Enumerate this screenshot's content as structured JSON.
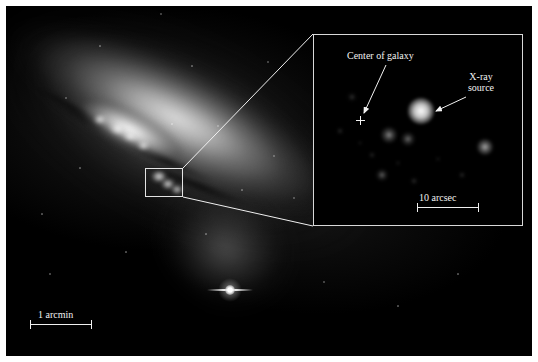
{
  "figure": {
    "domain": "astronomy-image",
    "background_color": "#ffffff",
    "plate_color": "#000000",
    "annotation_color": "#f2f2f2"
  },
  "main_image": {
    "name": "starburst-galaxy-m82",
    "description": "Optical image of an edge-on starburst galaxy with bright nucleus and dust lanes",
    "scalebar": {
      "label": "1 arcmin",
      "length_px": 62
    },
    "zoom_box": {
      "label": "nucleus-region",
      "x": 139,
      "y": 162,
      "width": 38,
      "height": 29
    },
    "bright_star": {
      "label": "foreground-star",
      "x": 224,
      "y": 284
    },
    "field_stars": [
      {
        "x": 60,
        "y": 92,
        "r": 0.8
      },
      {
        "x": 94,
        "y": 40,
        "r": 0.7
      },
      {
        "x": 155,
        "y": 8,
        "r": 1.0
      },
      {
        "x": 186,
        "y": 60,
        "r": 0.7
      },
      {
        "x": 212,
        "y": 120,
        "r": 0.8
      },
      {
        "x": 262,
        "y": 56,
        "r": 0.8
      },
      {
        "x": 268,
        "y": 150,
        "r": 0.9
      },
      {
        "x": 288,
        "y": 192,
        "r": 0.8
      },
      {
        "x": 74,
        "y": 162,
        "r": 0.7
      },
      {
        "x": 36,
        "y": 208,
        "r": 0.7
      },
      {
        "x": 120,
        "y": 246,
        "r": 0.7
      },
      {
        "x": 200,
        "y": 228,
        "r": 0.7
      },
      {
        "x": 318,
        "y": 276,
        "r": 0.8
      },
      {
        "x": 392,
        "y": 300,
        "r": 0.7
      },
      {
        "x": 452,
        "y": 268,
        "r": 0.7
      },
      {
        "x": 44,
        "y": 268,
        "r": 0.6
      },
      {
        "x": 166,
        "y": 118,
        "r": 0.7
      },
      {
        "x": 236,
        "y": 184,
        "r": 0.7
      }
    ]
  },
  "inset": {
    "name": "x-ray-inset",
    "description": "Chandra X-ray close-up of the galaxy nucleus region",
    "labels": {
      "center_of_galaxy": "Center of galaxy",
      "xray_source": "X-ray\nsource",
      "xray_source_line1": "X-ray",
      "xray_source_line2": "source"
    },
    "scalebar": {
      "label": "10 arcsec",
      "length_px": 62
    },
    "center_marker": {
      "glyph": "+",
      "x": 46,
      "y": 85
    },
    "sources": [
      {
        "name": "bright-xray-source",
        "x": 107,
        "y": 76,
        "r": 13,
        "brightness": 1.0
      },
      {
        "name": "source-b",
        "x": 75,
        "y": 100,
        "r": 8,
        "brightness": 0.5
      },
      {
        "name": "source-c",
        "x": 94,
        "y": 104,
        "r": 7,
        "brightness": 0.42
      },
      {
        "name": "source-d",
        "x": 171,
        "y": 112,
        "r": 8,
        "brightness": 0.62
      },
      {
        "name": "source-e",
        "x": 68,
        "y": 140,
        "r": 6,
        "brightness": 0.38
      },
      {
        "name": "source-f",
        "x": 100,
        "y": 146,
        "r": 4,
        "brightness": 0.22
      },
      {
        "name": "source-g",
        "x": 148,
        "y": 140,
        "r": 4,
        "brightness": 0.2
      },
      {
        "name": "source-h",
        "x": 38,
        "y": 62,
        "r": 5,
        "brightness": 0.22
      },
      {
        "name": "source-i",
        "x": 26,
        "y": 96,
        "r": 4,
        "brightness": 0.2
      },
      {
        "name": "source-j",
        "x": 58,
        "y": 120,
        "r": 4,
        "brightness": 0.18
      },
      {
        "name": "source-k",
        "x": 84,
        "y": 128,
        "r": 3,
        "brightness": 0.16
      },
      {
        "name": "source-l",
        "x": 124,
        "y": 124,
        "r": 3,
        "brightness": 0.15
      },
      {
        "name": "source-m",
        "x": 46,
        "y": 108,
        "r": 3,
        "brightness": 0.14
      }
    ]
  }
}
